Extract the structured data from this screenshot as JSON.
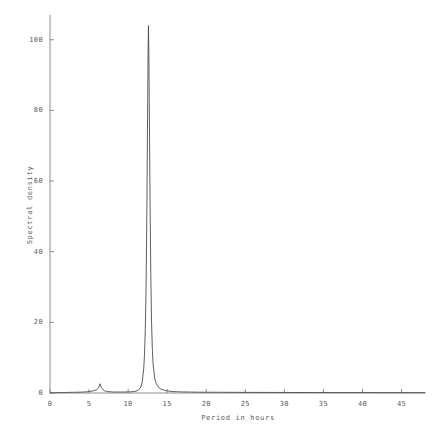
{
  "chart_data": {
    "type": "line",
    "title": "",
    "xlabel": "Period in hours",
    "ylabel": "Spectral density",
    "xlim": [
      0,
      48
    ],
    "ylim": [
      0,
      107
    ],
    "xticks": [
      0,
      5,
      10,
      15,
      20,
      25,
      30,
      35,
      40,
      45
    ],
    "yticks": [
      0,
      20,
      40,
      60,
      80,
      100
    ],
    "xtick_labels": [
      "0",
      "5",
      "10",
      "15",
      "20",
      "25",
      "30",
      "35",
      "40",
      "45"
    ],
    "ytick_labels": [
      "0",
      "20",
      "40",
      "60",
      "80",
      "100"
    ],
    "grid": false,
    "legend": null,
    "line_color": "#4d4d4d",
    "axis_color": "#8c8c8c",
    "background": "#ffffff",
    "annotations": [
      {
        "label": "main semi-diurnal peak",
        "x": 12.6,
        "y": 104
      },
      {
        "label": "minor peak",
        "x": 6.4,
        "y": 2.6
      }
    ],
    "series": [
      {
        "name": "Spectral density",
        "x": [
          0.0,
          0.5,
          1.0,
          1.5,
          2.0,
          2.5,
          3.0,
          3.5,
          4.0,
          4.5,
          5.0,
          5.4,
          5.8,
          6.0,
          6.2,
          6.4,
          6.6,
          6.8,
          7.0,
          7.4,
          8.0,
          8.5,
          9.0,
          9.5,
          10.0,
          10.5,
          11.0,
          11.3,
          11.6,
          11.8,
          12.0,
          12.1,
          12.2,
          12.3,
          12.4,
          12.5,
          12.55,
          12.6,
          12.65,
          12.7,
          12.8,
          12.9,
          13.0,
          13.1,
          13.2,
          13.4,
          13.6,
          13.9,
          14.2,
          14.6,
          15.0,
          15.5,
          16.0,
          16.5,
          17.0,
          18.0,
          19.0,
          20.0,
          22.0,
          24.0,
          26.0,
          28.0,
          30.0,
          32.0,
          34.0,
          36.0,
          38.0,
          40.0,
          42.0,
          44.0,
          46.0,
          48.0
        ],
        "y": [
          0.0,
          0.05,
          0.1,
          0.12,
          0.15,
          0.18,
          0.2,
          0.22,
          0.25,
          0.3,
          0.4,
          0.55,
          0.8,
          1.0,
          1.4,
          2.6,
          1.5,
          0.9,
          0.6,
          0.4,
          0.3,
          0.28,
          0.27,
          0.28,
          0.3,
          0.35,
          0.5,
          0.8,
          1.6,
          3.0,
          7.0,
          11.0,
          18.0,
          30.0,
          52.0,
          82.0,
          96.0,
          104.0,
          97.0,
          84.0,
          56.0,
          34.0,
          20.0,
          12.5,
          8.0,
          4.2,
          2.6,
          1.6,
          1.1,
          0.8,
          0.6,
          0.45,
          0.38,
          0.33,
          0.3,
          0.26,
          0.23,
          0.22,
          0.2,
          0.18,
          0.17,
          0.16,
          0.15,
          0.14,
          0.13,
          0.13,
          0.12,
          0.12,
          0.11,
          0.11,
          0.1,
          0.1
        ]
      }
    ]
  }
}
